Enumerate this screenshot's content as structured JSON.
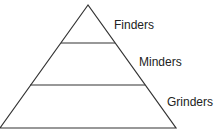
{
  "diagram": {
    "type": "pyramid",
    "levels": [
      {
        "label": "Finders",
        "position": "top"
      },
      {
        "label": "Minders",
        "position": "middle"
      },
      {
        "label": "Grinders",
        "position": "bottom"
      }
    ],
    "colors": {
      "line": "#333333",
      "text": "#222222",
      "background": "#ffffff"
    }
  }
}
